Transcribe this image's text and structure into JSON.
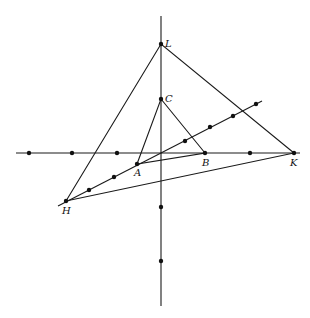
{
  "diagram": {
    "colors": {
      "stroke": "#1a1a1a",
      "background": "#ffffff"
    },
    "axes": {
      "horizontal": {
        "x1": 16,
        "y1": 153,
        "x2": 300,
        "y2": 153
      },
      "vertical": {
        "x1": 161,
        "y1": 16,
        "x2": 161,
        "y2": 306
      }
    },
    "points": {
      "L": {
        "label": "L",
        "x": 161,
        "y": 44
      },
      "C": {
        "label": "C",
        "x": 161,
        "y": 99
      },
      "A": {
        "label": "A",
        "x": 137,
        "y": 164
      },
      "B": {
        "label": "B",
        "x": 205,
        "y": 153
      },
      "K": {
        "label": "K",
        "x": 294,
        "y": 153
      },
      "H": {
        "label": "H",
        "x": 66,
        "y": 201
      }
    },
    "labels": [
      "L",
      "C",
      "A",
      "B",
      "K",
      "H"
    ],
    "extra_dots": {
      "horizontal": [
        29,
        72,
        117,
        250
      ],
      "vertical": [
        207,
        261
      ],
      "diagonal": [
        [
          89,
          190
        ],
        [
          114,
          177
        ],
        [
          185,
          141
        ],
        [
          210,
          127
        ],
        [
          233,
          116
        ],
        [
          256,
          104
        ]
      ]
    }
  }
}
